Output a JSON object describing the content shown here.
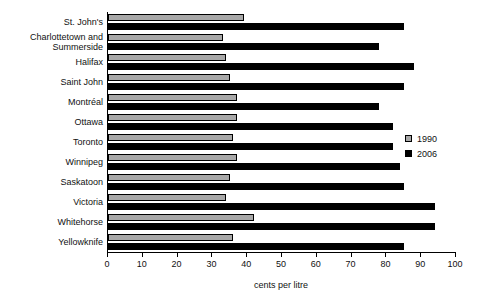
{
  "chart_data": {
    "type": "bar",
    "orientation": "horizontal",
    "title": "",
    "xlabel": "cents per litre",
    "ylabel": "",
    "xlim": [
      0,
      100
    ],
    "xticks": [
      0,
      10,
      20,
      30,
      40,
      50,
      60,
      70,
      80,
      90,
      100
    ],
    "xtick_labels": [
      "0",
      "10",
      "20",
      "30",
      "40",
      "50",
      "60",
      "70",
      "80",
      "90",
      "100"
    ],
    "grid": false,
    "legend_position": "right",
    "categories": [
      "St. John's",
      "Charlottetown and\nSummerside",
      "Halifax",
      "Saint John",
      "Montréal",
      "Ottawa",
      "Toronto",
      "Winnipeg",
      "Saskatoon",
      "Victoria",
      "Whitehorse",
      "Yellowknife"
    ],
    "series": [
      {
        "name": "1990",
        "color": "#a8a8a8",
        "values": [
          39,
          33,
          34,
          35,
          37,
          37,
          36,
          37,
          35,
          34,
          42,
          36
        ]
      },
      {
        "name": "2006",
        "color": "#000000",
        "values": [
          85,
          78,
          88,
          85,
          78,
          82,
          82,
          84,
          85,
          94,
          94,
          85
        ]
      }
    ]
  },
  "legend": {
    "items": [
      {
        "label": "1990",
        "swatch": "gray-swatch-icon"
      },
      {
        "label": "2006",
        "swatch": "black-swatch-icon"
      }
    ]
  }
}
